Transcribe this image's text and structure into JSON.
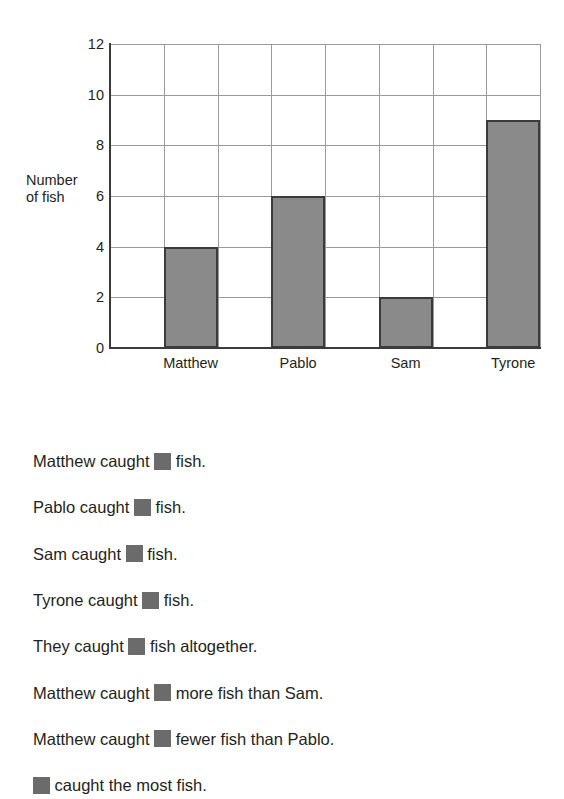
{
  "chart_data": {
    "type": "bar",
    "title": "",
    "xlabel": "",
    "ylabel": "Number\nof fish",
    "ylabel_lines": [
      "Number",
      "of fish"
    ],
    "categories": [
      "Matthew",
      "Pablo",
      "Sam",
      "Tyrone"
    ],
    "values": [
      4,
      6,
      2,
      9
    ],
    "ylim": [
      0,
      12
    ],
    "ytick_labels": [
      "0",
      "2",
      "4",
      "6",
      "8",
      "10",
      "12"
    ],
    "ytick_values": [
      0,
      2,
      4,
      6,
      8,
      10,
      12
    ],
    "grid": true,
    "legend": "none",
    "bar_fill_color": "#8a8a8a",
    "bar_border_color": "#3b3b3b",
    "gridline_color": "#9a9a9a",
    "axis_color": "#3b3b3b"
  },
  "questions": {
    "answer_box_color": "#6b6b6b",
    "lines": [
      {
        "before": "Matthew caught ",
        "after": " fish."
      },
      {
        "before": "Pablo caught ",
        "after": " fish."
      },
      {
        "before": "Sam caught ",
        "after": " fish."
      },
      {
        "before": "Tyrone caught ",
        "after": " fish."
      },
      {
        "before": "They caught ",
        "after": " fish altogether."
      },
      {
        "before": "Matthew caught ",
        "after": " more fish than Sam."
      },
      {
        "before": "Matthew caught ",
        "after": " fewer fish than Pablo."
      },
      {
        "before": "",
        "after": " caught the most fish."
      }
    ]
  }
}
